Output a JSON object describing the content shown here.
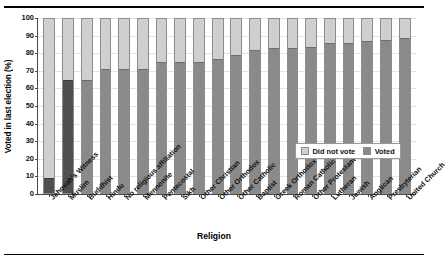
{
  "chart_data": {
    "type": "bar",
    "subtype": "stacked-100-percent",
    "title": "",
    "xlabel": "Religion",
    "ylabel": "Voted in last election (%)",
    "ylim": [
      0,
      100
    ],
    "yticks": [
      0,
      10,
      20,
      30,
      40,
      50,
      60,
      70,
      80,
      90,
      100
    ],
    "grid": true,
    "legend_position": "inside-right",
    "categories": [
      "Jehovah's Witness",
      "Muslim",
      "Buddhist",
      "Hindu",
      "No religious affiliation",
      "Mennonite",
      "Pentecostal",
      "Sikh",
      "Other Christian",
      "Other Orthodox",
      "Other Catholic",
      "Baptist",
      "Greek Orthodox",
      "Roman Catholic",
      "Other Protestant",
      "Lutheran",
      "Jewish",
      "Anglican",
      "Presbyterian",
      "United Church"
    ],
    "series": [
      {
        "name": "Voted",
        "color": "#8a8a8a",
        "values": [
          8,
          65,
          65,
          71,
          71,
          71,
          75,
          75,
          75,
          77,
          79,
          82,
          83,
          83,
          84,
          86,
          86,
          87,
          88,
          89
        ]
      },
      {
        "name": "Did not vote",
        "color": "#cfcfcf",
        "values": [
          92,
          35,
          35,
          29,
          29,
          29,
          25,
          25,
          25,
          23,
          21,
          18,
          17,
          17,
          16,
          14,
          14,
          13,
          12,
          11
        ]
      }
    ],
    "highlighted_categories": [
      "Jehovah's Witness",
      "Muslim"
    ],
    "legend": [
      {
        "label": "Did not vote",
        "swatch": "didnotvote"
      },
      {
        "label": "Voted",
        "swatch": "voted"
      }
    ]
  }
}
